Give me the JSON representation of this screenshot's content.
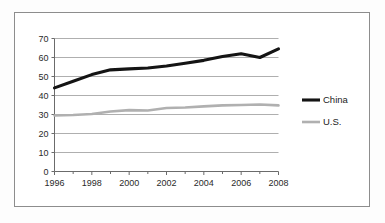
{
  "chart_data": {
    "type": "line",
    "title": "",
    "subtitle": "",
    "xlabel": "",
    "ylabel": "",
    "x": [
      1996,
      1997,
      1998,
      1999,
      2000,
      2001,
      2002,
      2003,
      2004,
      2005,
      2006,
      2007,
      2008
    ],
    "xlim": [
      1996,
      2008
    ],
    "ylim": [
      0,
      70
    ],
    "ytick_labels": [
      "0",
      "10",
      "20",
      "30",
      "40",
      "50",
      "60",
      "70"
    ],
    "ytick_values": [
      0,
      10,
      20,
      30,
      40,
      50,
      60,
      70
    ],
    "xtick_labels": [
      "1996",
      "1998",
      "2000",
      "2002",
      "2004",
      "2006",
      "2008"
    ],
    "xtick_values": [
      1996,
      1998,
      2000,
      2002,
      2004,
      2006,
      2008
    ],
    "xminor_values": [
      1997,
      1999,
      2001,
      2003,
      2005,
      2007
    ],
    "grid": "horizontal",
    "legend_position": "right",
    "series": [
      {
        "name": "China",
        "color": "#141414",
        "values": [
          44,
          47.5,
          51,
          53.5,
          54,
          54.5,
          55.5,
          57,
          58.5,
          60.5,
          62,
          60,
          64.5
        ]
      },
      {
        "name": "U.S.",
        "color": "#b0b0b0",
        "values": [
          29.5,
          29.7,
          30.3,
          31.6,
          32.3,
          32.1,
          33.4,
          33.7,
          34.3,
          34.8,
          35,
          35.3,
          34.8
        ]
      }
    ]
  },
  "legend": {
    "items": [
      {
        "label": "China",
        "color": "#141414"
      },
      {
        "label": "U.S.",
        "color": "#b0b0b0"
      }
    ]
  }
}
